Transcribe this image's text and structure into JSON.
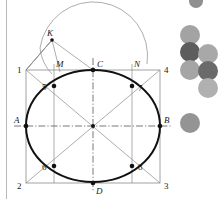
{
  "figure": {
    "background": "#ffffff",
    "stroke_light": "#8a8a8a",
    "stroke_dark": "#111111",
    "axis_color": "#555555",
    "rule_color": "#b9b9b9",
    "labels": {
      "corner_top_left": "1",
      "corner_bottom_left": "2",
      "corner_bottom_right": "3",
      "corner_top_right": "4",
      "point_5": "5",
      "point_6": "6",
      "point_7": "7",
      "point_8": "8",
      "point_A": "A",
      "point_B": "B",
      "point_C": "C",
      "point_D": "D",
      "point_K": "K",
      "point_M": "M",
      "point_N": "N"
    }
  },
  "circles": {
    "palette": {
      "light": "#a8a8a8",
      "medium": "#909090",
      "dark": "#5d5d5d",
      "pale": "#b4b4b4"
    },
    "items": [
      {
        "name": "circle-top-partial",
        "cx": 196,
        "cy": 1,
        "r": 7,
        "color": "#8f8f8f"
      },
      {
        "name": "circle-col1-row1",
        "cx": 190,
        "cy": 35,
        "r": 10,
        "color": "#a3a3a3"
      },
      {
        "name": "circle-col1-row2",
        "cx": 190,
        "cy": 52,
        "r": 10,
        "color": "#5d5d5d"
      },
      {
        "name": "circle-col2-row2",
        "cx": 208,
        "cy": 54,
        "r": 10,
        "color": "#a8a8a8"
      },
      {
        "name": "circle-col1-row3",
        "cx": 190,
        "cy": 70,
        "r": 10,
        "color": "#a5a5a5"
      },
      {
        "name": "circle-col2-row3",
        "cx": 208,
        "cy": 71,
        "r": 10,
        "color": "#6a6a6a"
      },
      {
        "name": "circle-col2-row4",
        "cx": 208,
        "cy": 88,
        "r": 10,
        "color": "#b0b0b0"
      },
      {
        "name": "circle-lower-single",
        "cx": 190,
        "cy": 123,
        "r": 10,
        "color": "#949494"
      }
    ]
  }
}
